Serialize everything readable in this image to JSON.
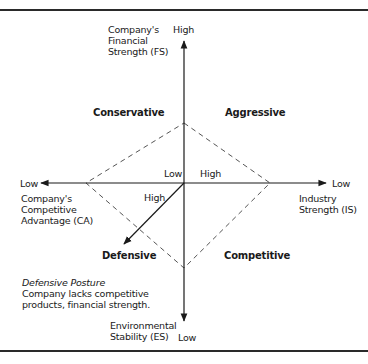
{
  "diagram": {
    "type": "SPACE matrix",
    "axes": {
      "top": {
        "name_lines": [
          "Company's",
          "Financial",
          "Strength (FS)"
        ],
        "end_label": "High"
      },
      "bottom": {
        "name_lines": [
          "Environmental",
          "Stability (ES)"
        ],
        "end_label": "Low"
      },
      "left": {
        "name_lines": [
          "Company's",
          "Competitive",
          "Advantage (CA)"
        ],
        "end_label": "Low"
      },
      "right": {
        "name_lines": [
          "Industry",
          "Strength (IS)"
        ],
        "end_label": "Low"
      },
      "center_labels": {
        "low": "Low",
        "high_right": "High",
        "high_diagonal": "High"
      }
    },
    "quadrants": {
      "top_left": "Conservative",
      "top_right": "Aggressive",
      "bottom_left": "Defensive",
      "bottom_right": "Competitive"
    },
    "note": {
      "title": "Defensive Posture",
      "lines": [
        "Company lacks competitive",
        "products, financial strength."
      ]
    },
    "colors": {
      "line": "#1a1a1a",
      "dash": "#555555",
      "frame": "#2a2a2a"
    }
  }
}
